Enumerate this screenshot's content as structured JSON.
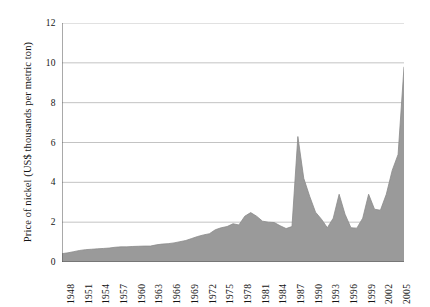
{
  "chart_data": {
    "type": "area",
    "title": "",
    "xlabel": "",
    "ylabel": "Price of nickel (US$ thousands per metric ton)",
    "ylim": [
      0,
      12
    ],
    "xlim": [
      1948,
      2006
    ],
    "yticks": [
      0,
      2,
      4,
      6,
      8,
      10,
      12
    ],
    "ytick_labels": [
      "0",
      "2",
      "4",
      "6",
      "8",
      "10",
      "12"
    ],
    "xtick_labels": [
      "1948",
      "1951",
      "1954",
      "1957",
      "1960",
      "1963",
      "1966",
      "1969",
      "1972",
      "1975",
      "1978",
      "1981",
      "1984",
      "1987",
      "1990",
      "1993",
      "1996",
      "1999",
      "2002",
      "2005"
    ],
    "xtick_years": [
      1948,
      1951,
      1954,
      1957,
      1960,
      1963,
      1966,
      1969,
      1972,
      1975,
      1978,
      1981,
      1984,
      1987,
      1990,
      1993,
      1996,
      1999,
      2002,
      2005
    ],
    "grid": "horizontal",
    "legend": "none",
    "fill_color": "#9a9a9a",
    "line_color": "#8a8a8a",
    "grid_color": "#b4b4b4",
    "axis_color": "#555555",
    "x": [
      1948,
      1949,
      1950,
      1951,
      1952,
      1953,
      1954,
      1955,
      1956,
      1957,
      1958,
      1959,
      1960,
      1961,
      1962,
      1963,
      1964,
      1965,
      1966,
      1967,
      1968,
      1969,
      1970,
      1971,
      1972,
      1973,
      1974,
      1975,
      1976,
      1977,
      1978,
      1979,
      1980,
      1981,
      1982,
      1983,
      1984,
      1985,
      1986,
      1987,
      1988,
      1989,
      1990,
      1991,
      1992,
      1993,
      1994,
      1995,
      1996,
      1997,
      1998,
      1999,
      2000,
      2001,
      2002,
      2003,
      2004,
      2005,
      2006
    ],
    "values": [
      0.42,
      0.46,
      0.52,
      0.58,
      0.62,
      0.64,
      0.66,
      0.68,
      0.7,
      0.74,
      0.76,
      0.76,
      0.78,
      0.79,
      0.8,
      0.8,
      0.86,
      0.9,
      0.92,
      0.96,
      1.02,
      1.08,
      1.18,
      1.28,
      1.36,
      1.42,
      1.62,
      1.72,
      1.78,
      1.92,
      1.86,
      2.3,
      2.48,
      2.3,
      2.05,
      2.0,
      1.98,
      1.82,
      1.68,
      1.78,
      6.3,
      4.2,
      3.3,
      2.5,
      2.15,
      1.72,
      2.2,
      3.4,
      2.4,
      1.72,
      1.7,
      2.2,
      3.4,
      2.65,
      2.6,
      3.4,
      4.6,
      5.4,
      9.8
    ],
    "value_unit": "US$ thousands per metric ton"
  }
}
